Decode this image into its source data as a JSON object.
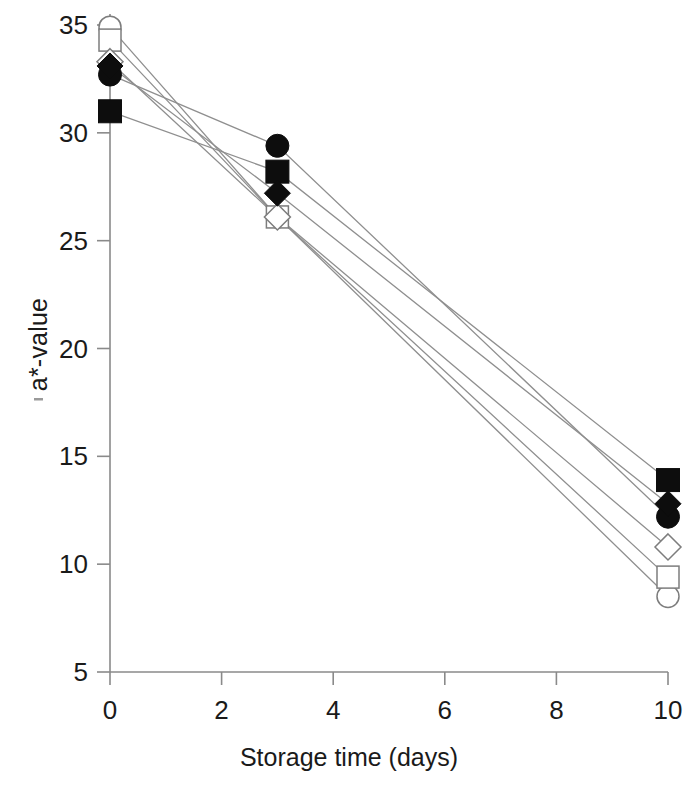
{
  "chart_data": {
    "type": "line",
    "title": "",
    "subtitle": "",
    "xlabel": "Storage time (days)",
    "ylabel": "a*-value",
    "x": [
      0,
      3,
      10
    ],
    "xlim": [
      0,
      10
    ],
    "ylim": [
      5,
      35
    ],
    "xticks": [
      0,
      2,
      4,
      6,
      8,
      10
    ],
    "yticks": [
      5,
      10,
      15,
      20,
      25,
      30,
      35
    ],
    "grid": false,
    "legend": "none",
    "series": [
      {
        "name": "filled-circle",
        "marker": "filled-circle",
        "values": [
          32.7,
          29.4,
          12.2
        ]
      },
      {
        "name": "filled-square",
        "marker": "filled-square",
        "values": [
          31.0,
          28.2,
          13.9
        ]
      },
      {
        "name": "filled-diamond",
        "marker": "filled-diamond",
        "values": [
          33.1,
          27.2,
          12.8
        ]
      },
      {
        "name": "open-circle",
        "marker": "open-circle",
        "values": [
          34.9,
          26.1,
          8.5
        ]
      },
      {
        "name": "open-square",
        "marker": "open-square",
        "values": [
          34.3,
          26.1,
          9.4
        ]
      },
      {
        "name": "open-diamond",
        "marker": "open-diamond",
        "values": [
          33.3,
          26.1,
          10.8
        ]
      }
    ]
  },
  "axes": {
    "x_tick_labels": [
      "0",
      "2",
      "4",
      "6",
      "8",
      "10"
    ],
    "y_tick_labels": [
      "35",
      "30",
      "25",
      "20",
      "15",
      "10",
      "5"
    ],
    "x_title": "Storage time (days)",
    "y_title": "a*-value"
  },
  "colors": {
    "marker_fill": "#0d0d0d",
    "marker_open_fill": "#ffffff",
    "marker_open_stroke": "#7d7d7d",
    "line": "#8f8f8f",
    "axis": "#8a8a8a",
    "text": "#1a1a1a",
    "background": "#ffffff"
  }
}
